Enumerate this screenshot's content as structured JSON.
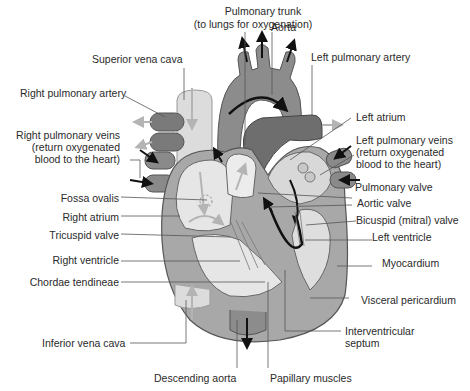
{
  "diagram": {
    "type": "labeled anatomical diagram",
    "colors": {
      "background": "#ffffff",
      "text": "#2a2a2a",
      "leader_line": "#555555",
      "vena_cava": "#dcdcdc",
      "aorta": "#8c8c8c",
      "pulmonary": "#6e6e6e",
      "myocardium": "#a8a8a8",
      "chamber": "#e6e6e6",
      "arrow_dark": "#111111",
      "arrow_light": "#b4b4b4"
    },
    "labels": {
      "pulmonary_trunk": "Pulmonary trunk",
      "pulmonary_trunk_note": "(to lungs for oxygenation)",
      "aorta": "Aorta",
      "superior_vena_cava": "Superior vena cava",
      "left_pulmonary_artery": "Left pulmonary artery",
      "right_pulmonary_artery": "Right pulmonary artery",
      "left_atrium": "Left atrium",
      "right_pulmonary_veins": "Right pulmonary veins",
      "right_pulmonary_veins_note1": "(return oxygenated",
      "right_pulmonary_veins_note2": "blood to the heart)",
      "left_pulmonary_veins": "Left pulmonary veins",
      "left_pulmonary_veins_note1": "(return oxygenated",
      "left_pulmonary_veins_note2": "blood to the heart)",
      "pulmonary_valve": "Pulmonary valve",
      "fossa_ovalis": "Fossa ovalis",
      "aortic_valve": "Aortic valve",
      "right_atrium": "Right atrium",
      "bicuspid_valve": "Bicuspid (mitral) valve",
      "tricuspid_valve": "Tricuspid valve",
      "left_ventricle": "Left ventricle",
      "right_ventricle": "Right ventricle",
      "myocardium": "Myocardium",
      "chordae_tendineae": "Chordae tendineae",
      "visceral_pericardium": "Visceral pericardium",
      "interventricular_septum_1": "Interventricular",
      "interventricular_septum_2": "septum",
      "inferior_vena_cava": "Inferior vena cava",
      "descending_aorta": "Descending aorta",
      "papillary_muscles": "Papillary muscles"
    }
  }
}
